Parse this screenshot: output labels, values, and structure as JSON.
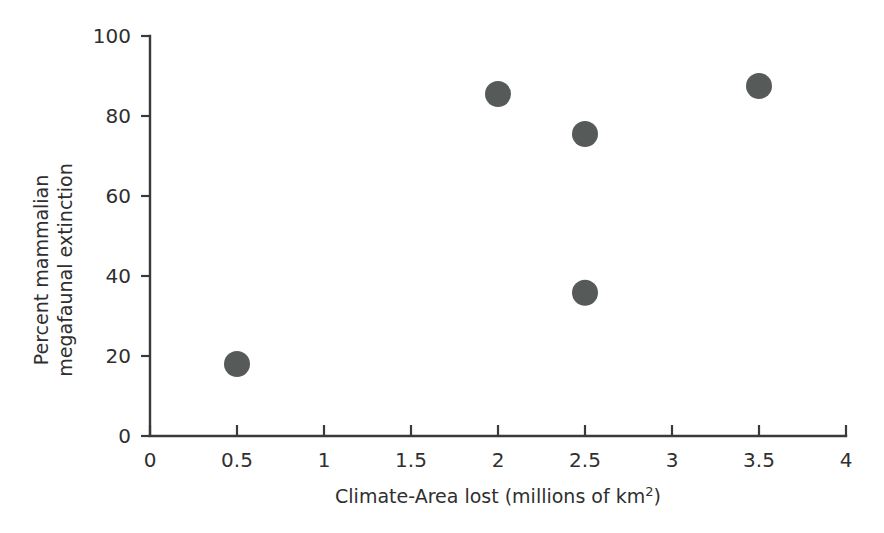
{
  "chart_data": {
    "type": "scatter",
    "title": "",
    "xlabel": "Climate-Area lost (millions of km²)",
    "ylabel_line1": "Percent mammalian",
    "ylabel_line2": "megafaunal extinction",
    "ylabel": "Percent mammalian megafaunal extinction",
    "xlim": [
      0,
      4
    ],
    "ylim": [
      0,
      100
    ],
    "xticks": [
      0,
      0.5,
      1,
      1.5,
      2,
      2.5,
      3,
      3.5,
      4
    ],
    "xtick_labels": [
      "0",
      "0.5",
      "1",
      "1.5",
      "2",
      "2.5",
      "3",
      "3.5",
      "4"
    ],
    "yticks": [
      0,
      20,
      40,
      60,
      80,
      100
    ],
    "ytick_labels": [
      "0",
      "20",
      "40",
      "60",
      "80",
      "100"
    ],
    "grid": false,
    "legend": "none",
    "marker": {
      "shape": "circle",
      "color": "#565b59",
      "radius_px": 13
    },
    "series": [
      {
        "name": "Continents",
        "points": [
          {
            "x": 0.5,
            "y": 18
          },
          {
            "x": 2.0,
            "y": 85.5
          },
          {
            "x": 2.5,
            "y": 75.5
          },
          {
            "x": 2.5,
            "y": 35.8
          },
          {
            "x": 3.5,
            "y": 87.5
          }
        ]
      }
    ]
  },
  "colors": {
    "background": "#ffffff",
    "axis": "#3a3a3a",
    "text": "#2f2f2f",
    "marker": "#565b59"
  }
}
